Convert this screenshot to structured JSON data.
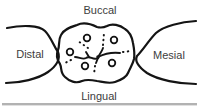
{
  "diagram": {
    "type": "dental-occlusal-surface-diagram",
    "labels": {
      "buccal": "Buccal",
      "distal": "Distal",
      "mesial": "Mesial",
      "lingual": "Lingual"
    },
    "cusp_tip_count": 5,
    "colors": {
      "line": "#141414",
      "text": "#3d3d3d",
      "rule": "#b2b2b2",
      "background": "#ffffff"
    }
  }
}
